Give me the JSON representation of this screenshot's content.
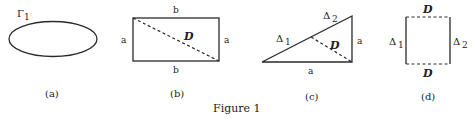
{
  "figure": {
    "caption": "Figure 1",
    "panels": [
      {
        "id": "a",
        "label": "(a)",
        "shape": "ellipse",
        "curve_label_main": "Γ",
        "curve_label_sub": "1"
      },
      {
        "id": "b",
        "label": "(b)",
        "shape": "rectangle",
        "top_label": "b",
        "bottom_label": "b",
        "left_label": "a",
        "right_label": "a",
        "diagonal_label": "D"
      },
      {
        "id": "c",
        "label": "(c)",
        "shape": "right-triangle",
        "hyp_label_left_main": "Δ",
        "hyp_label_left_sub": "1",
        "hyp_label_right_main": "Δ",
        "hyp_label_right_sub": "2",
        "right_label": "a",
        "bottom_label": "a",
        "dashed_label": "D"
      },
      {
        "id": "d",
        "label": "(d)",
        "shape": "square",
        "top_label": "D",
        "bottom_label": "D",
        "left_label_main": "Δ",
        "left_label_sub": "1",
        "right_label_main": "Δ",
        "right_label_sub": "2"
      }
    ]
  }
}
